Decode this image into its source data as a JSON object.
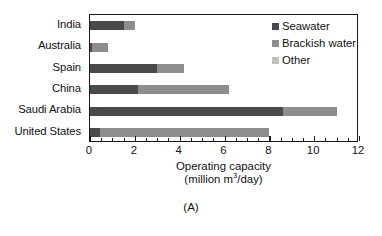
{
  "chart_data": {
    "type": "bar",
    "orientation": "horizontal",
    "stacked": true,
    "title": "",
    "xlabel": "Operating capacity (million m3/day)",
    "xlabel_line1": "Operating capacity",
    "xlabel_line2_prefix": "(million m",
    "xlabel_line2_sup": "3",
    "xlabel_line2_suffix": "/day)",
    "ylabel": "",
    "categories": [
      "India",
      "Australia",
      "Spain",
      "China",
      "Saudi Arabia",
      "United States"
    ],
    "xlim": [
      0,
      12
    ],
    "xticks": [
      0,
      2,
      4,
      6,
      8,
      10,
      12
    ],
    "xticklabels": [
      "0",
      "2",
      "4",
      "6",
      "8",
      "10",
      "12"
    ],
    "minor_tick_interval": 0.5,
    "grid": false,
    "legend_position": "upper right",
    "series": [
      {
        "name": "Seawater",
        "color": "#4a4a4a",
        "values": [
          1.5,
          0.1,
          3.0,
          2.15,
          8.6,
          0.45
        ]
      },
      {
        "name": "Brackish water",
        "color": "#8d8d8d",
        "values": [
          0.5,
          0.7,
          1.2,
          4.05,
          2.4,
          7.55
        ]
      },
      {
        "name": "Other",
        "color": "#c2c2c2",
        "values": [
          0.0,
          0.0,
          0.0,
          0.0,
          0.0,
          0.0
        ]
      }
    ],
    "totals": [
      2.0,
      0.8,
      4.2,
      6.2,
      11.0,
      8.0
    ],
    "caption": "(A)"
  },
  "legend": {
    "items": [
      {
        "label": "Seawater",
        "color": "#4a4a4a"
      },
      {
        "label": "Brackish water",
        "color": "#8d8d8d"
      },
      {
        "label": "Other",
        "color": "#c2c2c2"
      }
    ]
  },
  "caption": "(A)"
}
